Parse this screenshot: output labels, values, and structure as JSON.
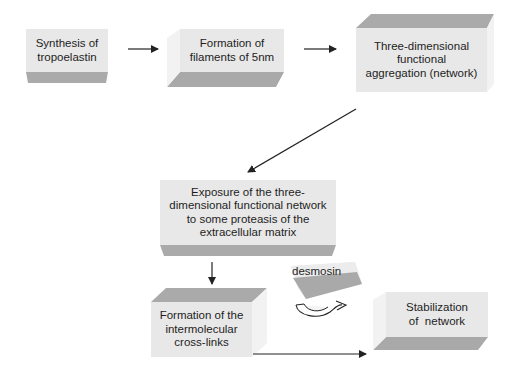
{
  "diagram": {
    "colors": {
      "face": "#e6e6e6",
      "shade": "#a9a9a9",
      "side": "#f0f0f0",
      "arrow": "#222222"
    },
    "steps": [
      {
        "id": "synthesis",
        "label": "Synthesis of tropoelastin",
        "lines": [
          "Synthesis of",
          "tropoelastin"
        ]
      },
      {
        "id": "filaments",
        "label": "Formation of filaments of 5nm",
        "lines": [
          "Formation of",
          "filaments of 5nm"
        ]
      },
      {
        "id": "aggregation",
        "label": "Three-dimensional functional aggregation (network)",
        "lines": [
          "Three-dimensional",
          "functional",
          "aggregation (network)"
        ]
      },
      {
        "id": "exposure",
        "label": "Exposure of the three-dimensional functional network to some proteasis of the extracellular matrix",
        "lines": [
          "Exposure of the three-",
          "dimensional functional network",
          "to some proteasis of the",
          "extracellular matrix"
        ]
      },
      {
        "id": "crosslinks",
        "label": "Formation of the intermolecular cross-links",
        "lines": [
          "Formation of the",
          "intermolecular",
          "cross-links"
        ]
      },
      {
        "id": "desmosin",
        "label": "desmosin",
        "lines": [
          "desmosin"
        ]
      },
      {
        "id": "stabilization",
        "label": "Stabilization of network",
        "lines": [
          "Stabilization",
          "of  network"
        ]
      }
    ],
    "arrows": [
      {
        "from": "synthesis",
        "to": "filaments"
      },
      {
        "from": "filaments",
        "to": "aggregation"
      },
      {
        "from": "aggregation",
        "to": "exposure"
      },
      {
        "from": "exposure",
        "to": "crosslinks"
      },
      {
        "from": "crosslinks",
        "to": "stabilization"
      },
      {
        "from": "desmosin",
        "to": "crosslinks",
        "type": "curved"
      }
    ]
  }
}
